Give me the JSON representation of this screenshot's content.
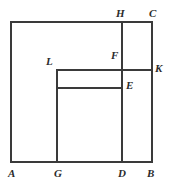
{
  "figure": {
    "background_color": "#ffffff",
    "stroke_color": "#3a3a3a",
    "stroke_width": 1.3,
    "canvas": {
      "width": 175,
      "height": 188
    },
    "segments": [
      {
        "name": "segment-AB-bottom",
        "x1": 11,
        "y1": 162,
        "x2": 152,
        "y2": 162
      },
      {
        "name": "segment-AH-top",
        "x1": 11,
        "y1": 22,
        "x2": 152,
        "y2": 22
      },
      {
        "name": "segment-A-left",
        "x1": 11,
        "y1": 22,
        "x2": 11,
        "y2": 162
      },
      {
        "name": "segment-CB-right",
        "x1": 152,
        "y1": 22,
        "x2": 152,
        "y2": 162
      },
      {
        "name": "segment-HD-vertical",
        "x1": 122,
        "y1": 22,
        "x2": 122,
        "y2": 162
      },
      {
        "name": "segment-LK-horizontal",
        "x1": 57,
        "y1": 70,
        "x2": 152,
        "y2": 70
      },
      {
        "name": "segment-LG-vertical",
        "x1": 57,
        "y1": 70,
        "x2": 57,
        "y2": 162
      },
      {
        "name": "segment-E-horizontal",
        "x1": 57,
        "y1": 88,
        "x2": 122,
        "y2": 88
      }
    ],
    "labels": [
      {
        "name": "vertex-label-H",
        "text": "H",
        "x": 116,
        "y": 8
      },
      {
        "name": "vertex-label-C",
        "text": "C",
        "x": 149,
        "y": 8
      },
      {
        "name": "vertex-label-F",
        "text": "F",
        "x": 111,
        "y": 50
      },
      {
        "name": "vertex-label-L",
        "text": "L",
        "x": 46,
        "y": 56
      },
      {
        "name": "vertex-label-K",
        "text": "K",
        "x": 155,
        "y": 63
      },
      {
        "name": "vertex-label-E",
        "text": "E",
        "x": 126,
        "y": 80
      },
      {
        "name": "vertex-label-A",
        "text": "A",
        "x": 8,
        "y": 168
      },
      {
        "name": "vertex-label-G",
        "text": "G",
        "x": 54,
        "y": 168
      },
      {
        "name": "vertex-label-D",
        "text": "D",
        "x": 118,
        "y": 168
      },
      {
        "name": "vertex-label-B",
        "text": "B",
        "x": 147,
        "y": 168
      }
    ]
  }
}
